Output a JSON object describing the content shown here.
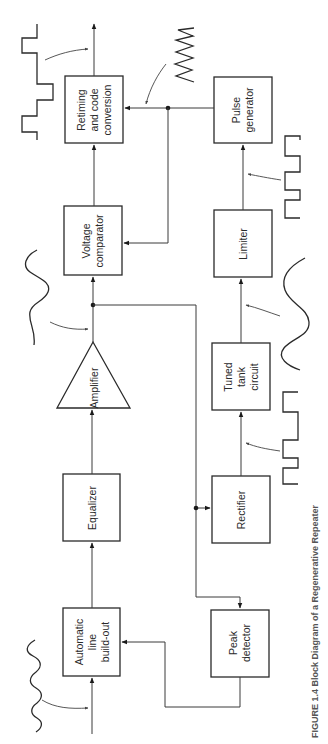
{
  "diagram": {
    "caption": "FIGURE 1.4 Block Diagram of a Regenerative Repeater",
    "blocks": {
      "albo": [
        "Automatic",
        "line",
        "build-out"
      ],
      "equalizer": [
        "Equalizer"
      ],
      "amplifier": [
        "Amplifier"
      ],
      "comparator": [
        "Voltage",
        "comparator"
      ],
      "retiming": [
        "Retiming",
        "and code",
        "conversion"
      ],
      "pulse_gen": [
        "Pulse",
        "generator"
      ],
      "limiter": [
        "Limiter"
      ],
      "tank": [
        "Tuned",
        "tank",
        "circuit"
      ],
      "rectifier": [
        "Rectifier"
      ],
      "peak": [
        "Peak",
        "detector"
      ]
    },
    "waveforms": [
      "distorted-input-wave",
      "amplified-sine-wave",
      "rectified-pulse-train",
      "tank-sine-wave",
      "limited-square-wave",
      "timing-spike-wave",
      "regenerated-output-pulses"
    ]
  }
}
